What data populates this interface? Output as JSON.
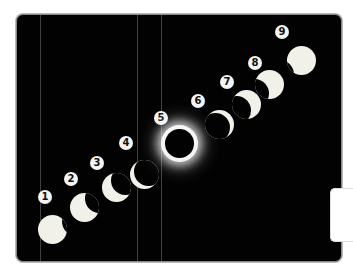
{
  "figure": {
    "phases": [
      {
        "label": "1"
      },
      {
        "label": "2"
      },
      {
        "label": "3"
      },
      {
        "label": "4"
      },
      {
        "label": "5"
      },
      {
        "label": "6"
      },
      {
        "label": "7"
      },
      {
        "label": "8"
      },
      {
        "label": "9"
      }
    ],
    "colors": {
      "background": "#020202",
      "sun": "#f1f1ea",
      "badge": "#f4f4f4"
    }
  }
}
